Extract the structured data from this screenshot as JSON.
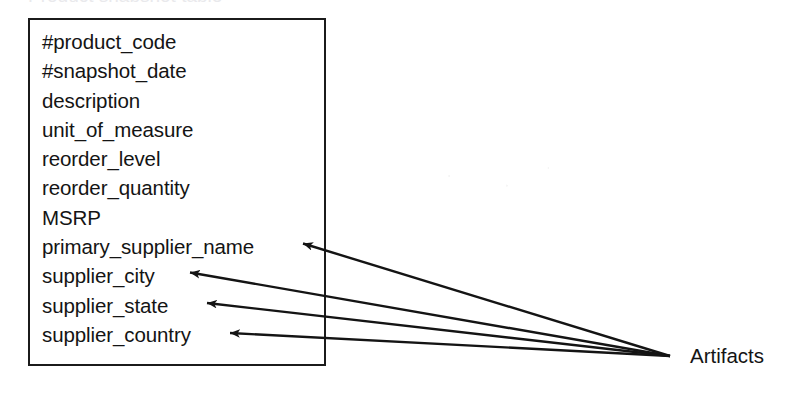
{
  "diagram": {
    "clipped_title": "Product snapshot table",
    "entity": {
      "name": "product-snapshot-entity",
      "fields": [
        "#product_code",
        "#snapshot_date",
        "description",
        "unit_of_measure",
        "reorder_level",
        "reorder_quantity",
        "MSRP",
        "primary_supplier_name",
        "supplier_city",
        "supplier_state",
        "supplier_country"
      ]
    },
    "annotation": {
      "label": "Artifacts",
      "target_fields": [
        "primary_supplier_name",
        "supplier_city",
        "supplier_state",
        "supplier_country"
      ],
      "arrow_count": 4
    },
    "colors": {
      "ink": "#141414",
      "border": "#1b1b1b",
      "background": "#ffffff"
    }
  }
}
